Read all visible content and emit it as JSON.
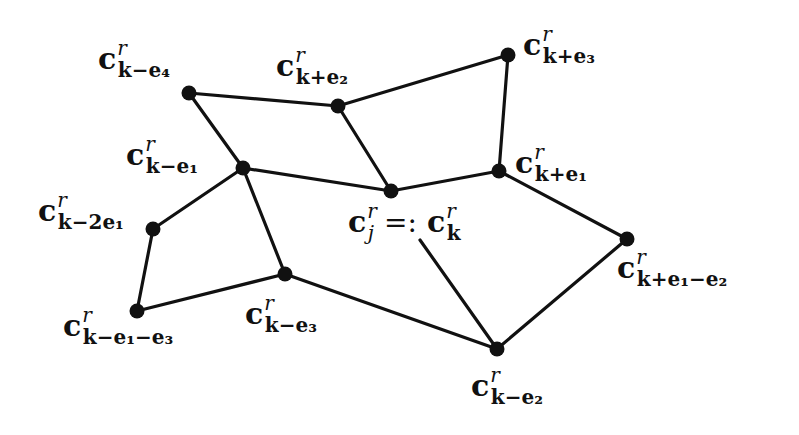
{
  "diagram": {
    "type": "graph",
    "title": "",
    "nodes": [
      {
        "id": "k_minus_e4",
        "x": 189,
        "y": 93,
        "base": "c",
        "sup": "r",
        "sub": "k−e₄"
      },
      {
        "id": "k_plus_e2",
        "x": 338,
        "y": 106,
        "base": "c",
        "sup": "r",
        "sub": "k+e₂"
      },
      {
        "id": "k_plus_e3",
        "x": 508,
        "y": 55,
        "base": "c",
        "sup": "r",
        "sub": "k+e₃"
      },
      {
        "id": "k_minus_e1",
        "x": 243,
        "y": 168,
        "base": "c",
        "sup": "r",
        "sub": "k−e₁"
      },
      {
        "id": "k",
        "x": 391,
        "y": 191,
        "base": "c",
        "sup": "r",
        "sub": "j",
        "alias": {
          "relation": "=:",
          "base": "c",
          "sup": "r",
          "sub": "k"
        }
      },
      {
        "id": "k_plus_e1",
        "x": 499,
        "y": 171,
        "base": "c",
        "sup": "r",
        "sub": "k+e₁"
      },
      {
        "id": "k_minus_2e1",
        "x": 153,
        "y": 229,
        "base": "c",
        "sup": "r",
        "sub": "k−2e₁"
      },
      {
        "id": "k_minus_e3",
        "x": 285,
        "y": 274,
        "base": "c",
        "sup": "r",
        "sub": "k−e₃"
      },
      {
        "id": "k_minus_e1_minus_e3",
        "x": 137,
        "y": 311,
        "base": "c",
        "sup": "r",
        "sub": "k−e₁−e₃"
      },
      {
        "id": "k_plus_e1_minus_e2",
        "x": 627,
        "y": 239,
        "base": "c",
        "sup": "r",
        "sub": "k+e₁−e₂"
      },
      {
        "id": "k_minus_e2",
        "x": 497,
        "y": 349,
        "base": "c",
        "sup": "r",
        "sub": "k−e₂"
      }
    ],
    "edges": [
      [
        "k_minus_e4",
        "k_plus_e2"
      ],
      [
        "k_plus_e2",
        "k_plus_e3"
      ],
      [
        "k_minus_e4",
        "k_minus_e1"
      ],
      [
        "k_plus_e2",
        "k"
      ],
      [
        "k_plus_e3",
        "k_plus_e1"
      ],
      [
        "k_minus_e1",
        "k"
      ],
      [
        "k",
        "k_plus_e1"
      ],
      [
        "k_minus_e1",
        "k_minus_2e1"
      ],
      [
        "k_minus_e1",
        "k_minus_e3"
      ],
      [
        "k_minus_2e1",
        "k_minus_e1_minus_e3"
      ],
      [
        "k_minus_e1_minus_e3",
        "k_minus_e3"
      ],
      [
        "k_minus_e3",
        "k_minus_e2"
      ],
      [
        "k_plus_e1",
        "k_plus_e1_minus_e2"
      ],
      [
        "k_plus_e1_minus_e2",
        "k_minus_e2"
      ]
    ],
    "extra_segments": [
      {
        "from": [
          420,
          240
        ],
        "to": [
          497,
          349
        ],
        "note": "line from label c_k^r down to c_{k-e2}"
      }
    ],
    "labels": [
      {
        "node": "k_minus_e4",
        "x": 98,
        "y": 44,
        "base": "c",
        "sup": "r",
        "sub": "k−e₄"
      },
      {
        "node": "k_plus_e2",
        "x": 276,
        "y": 51,
        "base": "c",
        "sup": "r",
        "sub": "k+e₂"
      },
      {
        "node": "k_plus_e3",
        "x": 523,
        "y": 30,
        "base": "c",
        "sup": "r",
        "sub": "k+e₃"
      },
      {
        "node": "k_minus_e1",
        "x": 126,
        "y": 140,
        "base": "c",
        "sup": "r",
        "sub": "k−e₁"
      },
      {
        "node": "k_plus_e1",
        "x": 515,
        "y": 148,
        "base": "c",
        "sup": "r",
        "sub": "k+e₁"
      },
      {
        "node": "k_minus_2e1",
        "x": 38,
        "y": 196,
        "base": "c",
        "sup": "r",
        "sub": "k−2e₁"
      },
      {
        "node": "k_minus_e3",
        "x": 245,
        "y": 299,
        "base": "c",
        "sup": "r",
        "sub": "k−e₃"
      },
      {
        "node": "k_minus_e1_minus_e3",
        "x": 63,
        "y": 311,
        "base": "c",
        "sup": "r",
        "sub": "k−e₁−e₃"
      },
      {
        "node": "k_plus_e1_minus_e2",
        "x": 617,
        "y": 253,
        "base": "c",
        "sup": "r",
        "sub": "k+e₁−e₂"
      },
      {
        "node": "k_minus_e2",
        "x": 471,
        "y": 371,
        "base": "c",
        "sup": "r",
        "sub": "k−e₂"
      }
    ],
    "center_label": {
      "x": 348,
      "y": 207,
      "base": "c",
      "sup": "r",
      "sub": "j",
      "relation": "=:",
      "alias_base": "c",
      "alias_sup": "r",
      "alias_sub": "k"
    },
    "colors": {
      "stroke": "#111111",
      "node_fill": "#111111",
      "background": "#ffffff"
    }
  }
}
